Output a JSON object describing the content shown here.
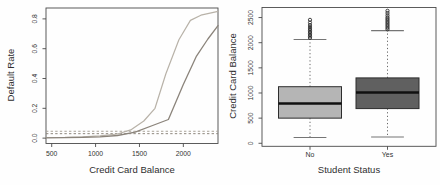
{
  "figure": {
    "background": "#fefefe",
    "frame_color": "#4a4a4a",
    "text_color": "#333333"
  },
  "chart_data": [
    {
      "type": "line",
      "title": "",
      "xlabel": "Credit Card Balance",
      "ylabel": "Default Rate",
      "xlim": [
        435,
        2395
      ],
      "ylim": [
        -0.036,
        0.873
      ],
      "grid": false,
      "legend": "none",
      "xticks": [
        500,
        1000,
        1500,
        2000
      ],
      "xtick_labels": [
        "500",
        "1000",
        "1500",
        "2000"
      ],
      "yticks": [
        0.0,
        0.2,
        0.4,
        0.6,
        0.8
      ],
      "ytick_labels": [
        "0.0",
        "0.2",
        "0.4",
        "0.6",
        "0.8"
      ],
      "series": [
        {
          "name": "student-default-rate-curve",
          "color": "#b8b2a8",
          "width": 1.2,
          "values": [
            [
              435,
              0.004
            ],
            [
              650,
              0.005
            ],
            [
              850,
              0.008
            ],
            [
              1050,
              0.015
            ],
            [
              1250,
              0.028
            ],
            [
              1400,
              0.055
            ],
            [
              1550,
              0.115
            ],
            [
              1677,
              0.2
            ],
            [
              1800,
              0.43
            ],
            [
              1950,
              0.66
            ],
            [
              2080,
              0.79
            ],
            [
              2200,
              0.825
            ],
            [
              2395,
              0.85
            ]
          ]
        },
        {
          "name": "non-student-default-rate-curve",
          "color": "#8b847b",
          "width": 1.3,
          "values": [
            [
              435,
              0.002
            ],
            [
              650,
              0.003
            ],
            [
              850,
              0.005
            ],
            [
              1050,
              0.009
            ],
            [
              1250,
              0.018
            ],
            [
              1450,
              0.04
            ],
            [
              1650,
              0.085
            ],
            [
              1830,
              0.125
            ],
            [
              2000,
              0.36
            ],
            [
              2150,
              0.55
            ],
            [
              2280,
              0.665
            ],
            [
              2395,
              0.755
            ]
          ]
        }
      ],
      "hlines": [
        {
          "name": "overall-student-rate",
          "value": 0.046,
          "color": "#a9a399",
          "style": "dashed"
        },
        {
          "name": "overall-non-student-rate",
          "value": 0.03,
          "color": "#8f887e",
          "style": "dashed"
        }
      ]
    },
    {
      "type": "box",
      "title": "",
      "xlabel": "Student Status",
      "ylabel": "Credit Card Balance",
      "ylim": [
        -60,
        2700
      ],
      "grid": false,
      "yticks": [
        0,
        500,
        1000,
        1500,
        2000,
        2500
      ],
      "ytick_labels": [
        "0",
        "500",
        "1000",
        "1500",
        "2000",
        "2500"
      ],
      "categories": [
        "No",
        "Yes"
      ],
      "boxes": [
        {
          "label": "No",
          "fill": "#b5b5b5",
          "q1": 500,
          "median": 790,
          "q3": 1125,
          "whisker_low": 115,
          "whisker_high": 2065,
          "outliers": [
            2095,
            2125,
            2155,
            2185,
            2215,
            2245,
            2275,
            2310,
            2350,
            2400,
            2455
          ]
        },
        {
          "label": "Yes",
          "fill": "#606060",
          "q1": 690,
          "median": 1010,
          "q3": 1300,
          "whisker_low": 125,
          "whisker_high": 2240,
          "outliers": [
            2265,
            2295,
            2325,
            2355,
            2385,
            2415,
            2445,
            2475,
            2505,
            2545,
            2590,
            2635
          ]
        }
      ],
      "box_style": {
        "border_color": "#2d2d2d",
        "median_color": "#101010",
        "whisker_color": "#555555",
        "cap_color": "#757575",
        "outlier_color": "#2e2e2e"
      }
    }
  ]
}
